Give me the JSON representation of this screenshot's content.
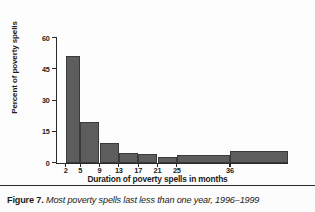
{
  "figure": {
    "caption_label": "Figure 7.",
    "caption_title": "Most poverty spells last less than one year, 1996–1999"
  },
  "chart_data": {
    "type": "bar",
    "title": "",
    "subtitle": "",
    "xlabel": "Duration of poverty spells in months",
    "ylabel": "Percent of poverty spells",
    "xlim": [
      0,
      48
    ],
    "ylim": [
      0,
      60
    ],
    "ytick_labels": [
      "0",
      "15",
      "30",
      "45",
      "60"
    ],
    "ytick_values": [
      0,
      15,
      30,
      45,
      60
    ],
    "xtick_labels": [
      "2",
      "5",
      "9",
      "13",
      "17",
      "21",
      "25",
      "36"
    ],
    "xtick_values": [
      2,
      5,
      9,
      13,
      17,
      21,
      25,
      36
    ],
    "grid": false,
    "legend": "none",
    "bar_fill_color": "#5d5d5d",
    "bar_edge_color": "#3b3b3b",
    "axis_color": "#2a2a2a",
    "categories": [
      "2–5",
      "5–9",
      "9–13",
      "13–17",
      "17–21",
      "21–25",
      "25–36",
      "36+"
    ],
    "values": [
      51,
      19.5,
      9.5,
      4.5,
      4,
      2.5,
      3.5,
      5.5
    ],
    "bars": [
      {
        "label": "2–5",
        "x_start": 2,
        "x_end": 5,
        "value": 51
      },
      {
        "label": "5–9",
        "x_start": 5,
        "x_end": 9,
        "value": 19.5
      },
      {
        "label": "9–13",
        "x_start": 9,
        "x_end": 13,
        "value": 9.5
      },
      {
        "label": "13–17",
        "x_start": 13,
        "x_end": 17,
        "value": 4.5
      },
      {
        "label": "17–21",
        "x_start": 17,
        "x_end": 21,
        "value": 4
      },
      {
        "label": "21–25",
        "x_start": 21,
        "x_end": 25,
        "value": 2.5
      },
      {
        "label": "25–36",
        "x_start": 25,
        "x_end": 36,
        "value": 3.5
      },
      {
        "label": "36+",
        "x_start": 36,
        "x_end": 48,
        "value": 5.5
      }
    ]
  }
}
